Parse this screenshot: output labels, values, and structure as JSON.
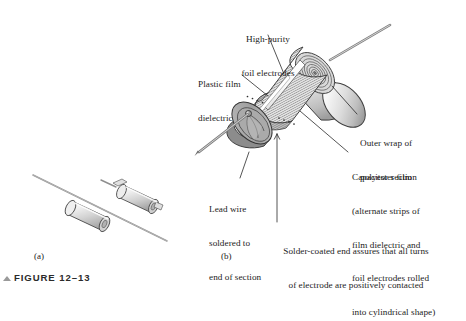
{
  "figure": {
    "marker_icon": "triangle-up-icon",
    "caption": "FIGURE 12–13"
  },
  "panels": [
    {
      "id": "a",
      "label": "(a)",
      "description": "Two axial plastic-film capacitors with lead wires"
    },
    {
      "id": "b",
      "label": "(b)",
      "description": "Cutaway view of plastic-film capacitor construction"
    }
  ],
  "callouts": {
    "high_purity_foil": {
      "lines": [
        "High-purity",
        "foil electrodes"
      ]
    },
    "plastic_film": {
      "lines": [
        "Plastic film",
        "dielectric"
      ]
    },
    "outer_wrap": {
      "lines": [
        "Outer wrap of",
        "polyester film"
      ]
    },
    "capacitor_section": {
      "lines": [
        "Capacitor section",
        "(alternate strips of",
        "film dielectric and",
        "foil electrodes rolled",
        "into cylindrical shape)"
      ]
    },
    "lead_wire": {
      "lines": [
        "Lead wire",
        "soldered to",
        "end of section"
      ]
    },
    "solder_coated": {
      "lines": [
        "Solder-coated end assures that all turns",
        "of electrode are positively contacted"
      ]
    }
  },
  "colors": {
    "background": "#ffffff",
    "ink": "#1c1c1c",
    "outline": "#3a3a3a",
    "body_light": "#f2f2f2",
    "body_mid": "#c9c9c9",
    "body_dark": "#8f8f8f",
    "wire": "#b4b4b4",
    "wire_dark": "#6e6e6e",
    "hatch": "#6a6a6a",
    "marker": "#9a9a9a"
  }
}
